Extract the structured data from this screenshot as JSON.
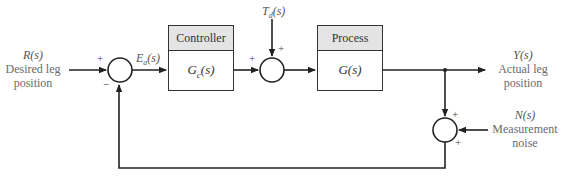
{
  "diagram": {
    "type": "feedback-control-block-diagram",
    "input": {
      "symbol": "R(s)",
      "line1": "Desired leg",
      "line2": "position"
    },
    "error_signal": "E_a(s)",
    "error_symbol": {
      "base": "E",
      "sub": "a",
      "arg": "(s)"
    },
    "disturbance": {
      "symbol": "T_d(s)",
      "base": "T",
      "sub": "d",
      "arg": "(s)"
    },
    "output": {
      "symbol": "Y(s)",
      "line1": "Actual leg",
      "line2": "position"
    },
    "noise": {
      "symbol": "N(s)",
      "line1": "Measurement",
      "line2": "noise"
    },
    "blocks": [
      {
        "id": "controller",
        "title": "Controller",
        "tf_base": "G",
        "tf_sub": "c",
        "tf_arg": "(s)"
      },
      {
        "id": "process",
        "title": "Process",
        "tf": "G(s)"
      }
    ],
    "summing_junctions": [
      {
        "id": "sum1",
        "signs": {
          "left": "+",
          "bottom": "−"
        }
      },
      {
        "id": "sum2",
        "signs": {
          "left": "+",
          "top": "+"
        }
      },
      {
        "id": "sum3",
        "signs": {
          "top": "+",
          "right": "+"
        }
      }
    ],
    "colors": {
      "line": "#222222",
      "block_header": "#e4e4e4",
      "label_text": "#6b6b6b"
    }
  }
}
